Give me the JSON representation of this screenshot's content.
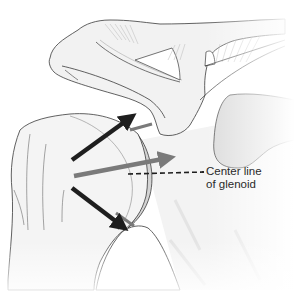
{
  "figure": {
    "labels": {
      "center_line_1": "Center line",
      "center_line_2": "of glenoid"
    },
    "arrows": [
      {
        "name": "superior-arrow",
        "color": "#1e1e1e",
        "direction": "up-right"
      },
      {
        "name": "center-arrow",
        "color": "#7a7a7a",
        "direction": "right"
      },
      {
        "name": "inferior-arrow",
        "color": "#1e1e1e",
        "direction": "down-right"
      }
    ],
    "colors": {
      "bone_fill": "#f4f4f4",
      "outline": "#3a3a3a",
      "dark_arrow": "#1e1e1e",
      "gray_arrow": "#7a7a7a",
      "shaded": "#dcdcdc"
    }
  }
}
